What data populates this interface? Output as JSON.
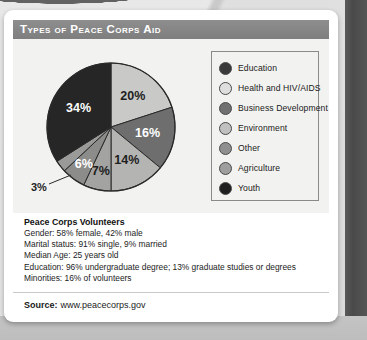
{
  "header": {
    "title": "Types of Peace Corps Aid"
  },
  "chart_data": {
    "type": "pie",
    "title": "Types of Peace Corps Aid",
    "legend_position": "right",
    "categories": [
      "Education",
      "Health and HIV/AIDS",
      "Business Development",
      "Environment",
      "Other",
      "Agriculture",
      "Youth"
    ],
    "values": [
      20,
      16,
      14,
      7,
      6,
      3,
      34
    ],
    "labels": [
      "20%",
      "16%",
      "14%",
      "7%",
      "6%",
      "3%",
      "34%"
    ],
    "colors": [
      "#c9c9c7",
      "#6e6e6e",
      "#b4b4b2",
      "#a3a3a1",
      "#8c8c8a",
      "#9a9a98",
      "#262626"
    ],
    "label_colors": [
      "dark",
      "light",
      "dark",
      "dark",
      "light",
      "dark",
      "light"
    ],
    "start_angle_deg": 0,
    "direction": "clockwise"
  },
  "legend": {
    "items": [
      {
        "label": "Education",
        "color": "#3a3a3a"
      },
      {
        "label": "Health and HIV/AIDS",
        "color": "#dedede"
      },
      {
        "label": "Business Development",
        "color": "#707070"
      },
      {
        "label": "Environment",
        "color": "#c0c0c0"
      },
      {
        "label": "Other",
        "color": "#8f8f8f"
      },
      {
        "label": "Agriculture",
        "color": "#9e9e9e"
      },
      {
        "label": "Youth",
        "color": "#1f1f1f"
      }
    ]
  },
  "stats": {
    "title": "Peace Corps Volunteers",
    "lines": [
      "Gender: 58% female, 42% male",
      "Marital status: 91% single, 9% married",
      "Median Age: 25 years old",
      "Education: 96% undergraduate degree; 13% graduate studies or degrees",
      "Minorities: 16% of volunteers"
    ]
  },
  "footer": {
    "label": "Source:",
    "value": "www.peacecorps.gov"
  }
}
